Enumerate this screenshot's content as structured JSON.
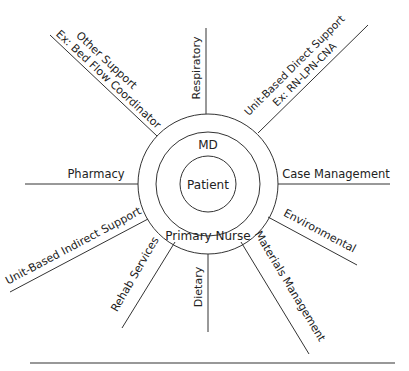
{
  "diagram": {
    "center": {
      "x": 208,
      "y": 184
    },
    "rings": {
      "outer": {
        "label": "Primary Nurse",
        "r": 70
      },
      "middle": {
        "label": "MD",
        "r": 52
      },
      "inner": {
        "label": "Patient",
        "r": 28
      }
    },
    "spokes": [
      {
        "id": "respiratory",
        "label": "Respiratory"
      },
      {
        "id": "unit-based-direct-support",
        "label": "Unit-Based Direct Support",
        "sublabel": "Ex: RN-LPN-CNA"
      },
      {
        "id": "case-management",
        "label": "Case Management"
      },
      {
        "id": "environmental",
        "label": "Environmental"
      },
      {
        "id": "materials-management",
        "label": "Materials Management"
      },
      {
        "id": "dietary",
        "label": "Dietary"
      },
      {
        "id": "rehab-services",
        "label": "Rehab Services"
      },
      {
        "id": "unit-based-indirect-support",
        "label": "Unit-Based Indirect Support"
      },
      {
        "id": "pharmacy",
        "label": "Pharmacy"
      },
      {
        "id": "other-support",
        "label": "Other Support",
        "sublabel": "Ex: Bed Flow Coordinator"
      }
    ],
    "stroke_color": "#333333",
    "text_color": "#222222"
  }
}
